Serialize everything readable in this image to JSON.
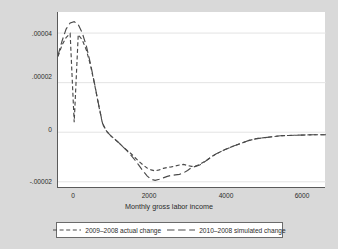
{
  "chart_data": {
    "type": "line",
    "title": "",
    "xlabel": "Monthly gross labor income",
    "ylabel": "Density",
    "xlim": [
      -300,
      6320
    ],
    "ylim": [
      -2.25e-05,
      4.85e-05
    ],
    "xticks": [
      0,
      2000,
      4000,
      6000
    ],
    "xticklabels": [
      "0",
      "2000",
      "4000",
      "6000"
    ],
    "yticks": [
      4e-05,
      2e-05,
      0,
      -2e-05
    ],
    "yticklabels": [
      ".00004",
      ".00002",
      "0",
      "-.00002"
    ],
    "grid": true,
    "grid_axis": "y",
    "legend_position": "below",
    "series": [
      {
        "name": "2009-2008 actual change",
        "dash": "short",
        "x": [
          -300,
          -200,
          -100,
          0,
          100,
          200,
          300,
          400,
          500,
          600,
          700,
          800,
          900,
          1000,
          1100,
          1200,
          1300,
          1400,
          1500,
          1600,
          1700,
          1800,
          1900,
          2000,
          2100,
          2200,
          2300,
          2400,
          2500,
          2600,
          2700,
          2800,
          2900,
          3000,
          3100,
          3200,
          3300,
          3400,
          3500,
          3600,
          3800,
          4000,
          4200,
          4400,
          4600,
          4800,
          5000,
          5200,
          5400,
          5600,
          5800,
          6000,
          6200,
          6320
        ],
        "y": [
          3.05e-05,
          3.52e-05,
          3.82e-05,
          3.98e-05,
          4e-06,
          3.94e-05,
          3.72e-05,
          3.32e-05,
          2.72e-05,
          1.96e-05,
          1.13e-05,
          3.4e-06,
          4e-07,
          -1.4e-06,
          -2.8e-06,
          -4.2e-06,
          -5.8e-06,
          -7.2e-06,
          -8.6e-06,
          -1.02e-05,
          -1.18e-05,
          -1.32e-05,
          -1.44e-05,
          -1.52e-05,
          -1.56e-05,
          -1.52e-05,
          -1.46e-05,
          -1.42e-05,
          -1.4e-05,
          -1.36e-05,
          -1.32e-05,
          -1.3e-05,
          -1.34e-05,
          -1.38e-05,
          -1.36e-05,
          -1.3e-05,
          -1.2e-05,
          -1.1e-05,
          -9.8e-06,
          -8.8e-06,
          -7.2e-06,
          -5.8e-06,
          -4.6e-06,
          -3.4e-06,
          -2.6e-06,
          -2.2e-06,
          -1.8e-06,
          -1.4e-06,
          -1.3e-06,
          -1.2e-06,
          -1.1e-06,
          -1e-06,
          -1e-06,
          -1e-06
        ]
      },
      {
        "name": "2010-2008 simulated change",
        "dash": "long",
        "x": [
          -300,
          -200,
          -100,
          0,
          100,
          200,
          300,
          400,
          500,
          600,
          700,
          800,
          900,
          1000,
          1100,
          1200,
          1300,
          1400,
          1500,
          1600,
          1700,
          1800,
          1900,
          2000,
          2100,
          2200,
          2300,
          2400,
          2500,
          2600,
          2700,
          2800,
          2900,
          3000,
          3100,
          3200,
          3300,
          3400,
          3500,
          3600,
          3800,
          4000,
          4200,
          4400,
          4600,
          4800,
          5000,
          5200,
          5400,
          5600,
          5800,
          6000,
          6200,
          6320
        ],
        "y": [
          3.1e-05,
          3.68e-05,
          4.16e-05,
          4.41e-05,
          4.46e-05,
          4.34e-05,
          4e-05,
          3.48e-05,
          2.78e-05,
          1.98e-05,
          1.14e-05,
          3.6e-06,
          4e-07,
          -1.4e-06,
          -2.8e-06,
          -4.2e-06,
          -5.8e-06,
          -7.4e-06,
          -9.2e-06,
          -1.12e-05,
          -1.34e-05,
          -1.56e-05,
          -1.76e-05,
          -1.9e-05,
          -1.94e-05,
          -1.9e-05,
          -1.84e-05,
          -1.78e-05,
          -1.74e-05,
          -1.72e-05,
          -1.7e-05,
          -1.64e-05,
          -1.54e-05,
          -1.42e-05,
          -1.38e-05,
          -1.32e-05,
          -1.22e-05,
          -1.1e-05,
          -9.8e-06,
          -8.8e-06,
          -7.2e-06,
          -5.8e-06,
          -4.6e-06,
          -3.4e-06,
          -2.6e-06,
          -2.2e-06,
          -1.8e-06,
          -1.4e-06,
          -1.3e-06,
          -1.2e-06,
          -1.1e-06,
          -1e-06,
          -1e-06,
          -1e-06
        ]
      }
    ]
  },
  "axes": {
    "y_title": "Density",
    "x_title": "Monthly gross labor income",
    "ytick_0": ".00004",
    "ytick_1": ".00002",
    "ytick_2": "0",
    "ytick_3": "-.00002",
    "xtick_0": "0",
    "xtick_1": "2000",
    "xtick_2": "4000",
    "xtick_3": "6000"
  },
  "legend": {
    "entry_0": "2009–2008 actual change",
    "entry_1": "2010–2008 simulated change"
  },
  "colors": {
    "background": "#d9d9d9",
    "plot_background": "#ffffff",
    "curve": "#4a4a4a",
    "axis": "#5a5a5a",
    "grid": "#e3e3e3",
    "text": "#2b2b2b"
  }
}
